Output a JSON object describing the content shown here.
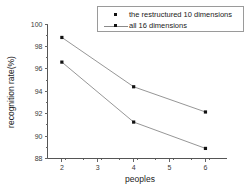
{
  "chart_data": {
    "type": "line",
    "title": "",
    "xlabel": "peoples",
    "ylabel": "recognition rate(%)",
    "x": [
      2,
      4,
      6
    ],
    "xlim": [
      1.6,
      6.6
    ],
    "ylim": [
      88,
      100
    ],
    "xticks": [
      "2",
      "3",
      "4",
      "5",
      "6"
    ],
    "xtick_values": [
      2,
      3,
      4,
      5,
      6
    ],
    "yticks": [
      "88",
      "90",
      "92",
      "94",
      "96",
      "98",
      "100"
    ],
    "ytick_values": [
      88,
      90,
      92,
      94,
      96,
      98,
      100
    ],
    "grid": false,
    "legend_position": "top-right",
    "marker_color": "#111111",
    "line_color": "#8a8a8a",
    "series": [
      {
        "name": "the restructured 10 dimensions",
        "values": [
          98.8,
          94.4,
          92.15
        ],
        "legend_has_line": false
      },
      {
        "name": "all 16 dimensions",
        "values": [
          96.6,
          91.25,
          88.9
        ],
        "legend_has_line": true
      }
    ]
  },
  "legend": {
    "entries": [
      {
        "label": "the restructured 10 dimensions"
      },
      {
        "label": "all 16 dimensions"
      }
    ]
  },
  "axes": {
    "x_title": "peoples",
    "y_title": "recognition rate(%)"
  }
}
